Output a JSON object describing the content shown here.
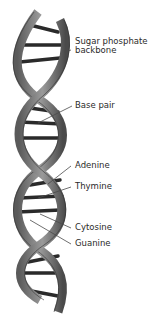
{
  "diagram": {
    "colors": {
      "backbone_light": "#8a8a8a",
      "backbone_dark": "#3d3d3d",
      "base_pair": "#2a2a2a",
      "leader_line": "#4a4a4a",
      "text": "#2b2b2b",
      "background": "#ffffff"
    },
    "labels": [
      {
        "id": "sugar-phosphate",
        "line1": "Sugar phosphate",
        "line2": "backbone"
      },
      {
        "id": "base-pair",
        "line1": "Base pair"
      },
      {
        "id": "adenine",
        "line1": "Adenine"
      },
      {
        "id": "thymine",
        "line1": "Thymine"
      },
      {
        "id": "cytosine",
        "line1": "Cytosine"
      },
      {
        "id": "guanine",
        "line1": "Guanine"
      }
    ]
  }
}
